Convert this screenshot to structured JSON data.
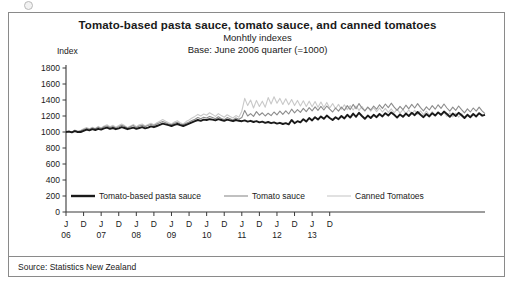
{
  "title": "Tomato-based pasta sauce, tomato sauce, and canned tomatoes",
  "subtitle": "Monhtly indexes",
  "subtitle2": "Base: June 2006 quarter (=1000)",
  "axis_label": "Index",
  "source": "Source: Statistics New Zealand",
  "colors": {
    "series1": "#1a1a1a",
    "series2": "#8c8c8c",
    "series3": "#c9c9c9",
    "frame": "#8a8a8a",
    "axis": "#3a3a3a",
    "background": "#ffffff"
  },
  "chart_data": {
    "type": "line",
    "title": "Tomato-based pasta sauce, tomato sauce, and canned tomatoes",
    "subtitle": "Monhtly indexes",
    "xlabel": "",
    "ylabel": "Index",
    "ylim": [
      0,
      1800
    ],
    "ytick_step": 200,
    "yticks": [
      0,
      200,
      400,
      600,
      800,
      1000,
      1200,
      1400,
      1600,
      1800
    ],
    "grid": false,
    "legend_position": "inside-bottom",
    "x_start": "2006-01",
    "x_end": "2013-12",
    "x_tick_labels": [
      "J",
      "D",
      "J",
      "D",
      "J",
      "D",
      "J",
      "D",
      "J",
      "D",
      "J",
      "D",
      "J",
      "D",
      "J",
      "D"
    ],
    "x_year_labels": [
      "06",
      "07",
      "08",
      "09",
      "10",
      "11",
      "12",
      "13"
    ],
    "series": [
      {
        "name": "Tomato-based pasta sauce",
        "color": "#1a1a1a",
        "width": 1.9,
        "values": [
          1000,
          1005,
          995,
          1010,
          1000,
          1000,
          1015,
          1030,
          1020,
          1035,
          1025,
          1040,
          1030,
          1045,
          1055,
          1040,
          1050,
          1035,
          1045,
          1060,
          1050,
          1035,
          1045,
          1055,
          1040,
          1050,
          1060,
          1045,
          1055,
          1070,
          1060,
          1075,
          1090,
          1105,
          1095,
          1085,
          1075,
          1090,
          1100,
          1085,
          1075,
          1090,
          1105,
          1120,
          1135,
          1150,
          1140,
          1155,
          1150,
          1160,
          1155,
          1145,
          1160,
          1150,
          1140,
          1155,
          1145,
          1135,
          1150,
          1140,
          1135,
          1145,
          1130,
          1140,
          1125,
          1135,
          1120,
          1130,
          1115,
          1125,
          1110,
          1120,
          1105,
          1115,
          1100,
          1110,
          1095,
          1150,
          1110,
          1135,
          1120,
          1160,
          1130,
          1175,
          1145,
          1185,
          1155,
          1195,
          1165,
          1205,
          1175,
          1150,
          1185,
          1160,
          1200,
          1170,
          1215,
          1180,
          1230,
          1190,
          1240,
          1200,
          1165,
          1205,
          1175,
          1215,
          1185,
          1225,
          1195,
          1235,
          1205,
          1245,
          1215,
          1180,
          1220,
          1190,
          1230,
          1200,
          1240,
          1210,
          1250,
          1215,
          1185,
          1225,
          1195,
          1235,
          1205,
          1245,
          1215,
          1255,
          1225,
          1190,
          1230,
          1200,
          1240,
          1210,
          1175,
          1215,
          1185,
          1225,
          1195,
          1235,
          1205,
          1215
        ]
      },
      {
        "name": "Tomato sauce",
        "color": "#8c8c8c",
        "width": 1.1,
        "values": [
          1000,
          1010,
          1000,
          1020,
          1005,
          1015,
          1030,
          1045,
          1035,
          1050,
          1040,
          1060,
          1045,
          1065,
          1075,
          1055,
          1070,
          1050,
          1065,
          1085,
          1070,
          1050,
          1065,
          1080,
          1055,
          1075,
          1085,
          1065,
          1080,
          1095,
          1080,
          1100,
          1115,
          1130,
          1115,
          1100,
          1090,
          1110,
          1120,
          1100,
          1090,
          1110,
          1125,
          1145,
          1160,
          1180,
          1165,
          1185,
          1175,
          1195,
          1180,
          1165,
          1190,
          1170,
          1155,
          1180,
          1165,
          1150,
          1175,
          1160,
          1180,
          1270,
          1200,
          1230,
          1195,
          1255,
          1210,
          1240,
          1200,
          1235,
          1205,
          1250,
          1215,
          1260,
          1220,
          1265,
          1225,
          1285,
          1240,
          1280,
          1245,
          1295,
          1255,
          1305,
          1265,
          1315,
          1270,
          1320,
          1275,
          1325,
          1285,
          1250,
          1300,
          1260,
          1310,
          1270,
          1330,
          1280,
          1345,
          1290,
          1355,
          1300,
          1265,
          1310,
          1275,
          1325,
          1285,
          1340,
          1295,
          1350,
          1305,
          1360,
          1310,
          1270,
          1320,
          1280,
          1335,
          1290,
          1345,
          1300,
          1355,
          1305,
          1265,
          1315,
          1275,
          1330,
          1285,
          1340,
          1295,
          1350,
          1300,
          1260,
          1310,
          1270,
          1325,
          1280,
          1240,
          1290,
          1250,
          1300,
          1260,
          1310,
          1265,
          1230
        ]
      },
      {
        "name": "Canned Tomatoes",
        "color": "#c9c9c9",
        "width": 1.1,
        "values": [
          1000,
          1015,
          1000,
          1025,
          1005,
          1020,
          1040,
          1055,
          1040,
          1060,
          1045,
          1070,
          1050,
          1075,
          1090,
          1065,
          1085,
          1060,
          1080,
          1100,
          1080,
          1055,
          1075,
          1095,
          1065,
          1090,
          1100,
          1075,
          1095,
          1110,
          1090,
          1115,
          1135,
          1155,
          1135,
          1115,
          1100,
          1125,
          1140,
          1115,
          1100,
          1130,
          1150,
          1175,
          1195,
          1220,
          1200,
          1225,
          1210,
          1240,
          1220,
          1195,
          1230,
          1205,
          1185,
          1215,
          1195,
          1175,
          1205,
          1185,
          1260,
          1420,
          1330,
          1400,
          1300,
          1395,
          1320,
          1385,
          1310,
          1430,
          1350,
          1440,
          1360,
          1420,
          1345,
          1415,
          1340,
          1405,
          1330,
          1395,
          1325,
          1390,
          1320,
          1385,
          1315,
          1380,
          1310,
          1375,
          1305,
          1370,
          1300,
          1355,
          1290,
          1345,
          1285,
          1340,
          1280,
          1330,
          1275,
          1325,
          1270,
          1320,
          1265,
          1310,
          1260,
          1305,
          1255,
          1300,
          1250,
          1295,
          1245,
          1290,
          1240,
          1285,
          1235,
          1280,
          1230,
          1275,
          1225,
          1270,
          1220,
          1265,
          1215,
          1260,
          1210,
          1255,
          1205,
          1250,
          1200,
          1245,
          1195,
          1240,
          1190,
          1235,
          1185,
          1230,
          1180,
          1225,
          1175,
          1220,
          1185,
          1230,
          1195,
          1215
        ]
      }
    ],
    "legend": [
      {
        "label": "Tomato-based pasta sauce",
        "color": "#1a1a1a",
        "width": 2.4
      },
      {
        "label": "Tomato sauce",
        "color": "#8c8c8c",
        "width": 1.1
      },
      {
        "label": "Canned Tomatoes",
        "color": "#c9c9c9",
        "width": 1.1
      }
    ]
  }
}
